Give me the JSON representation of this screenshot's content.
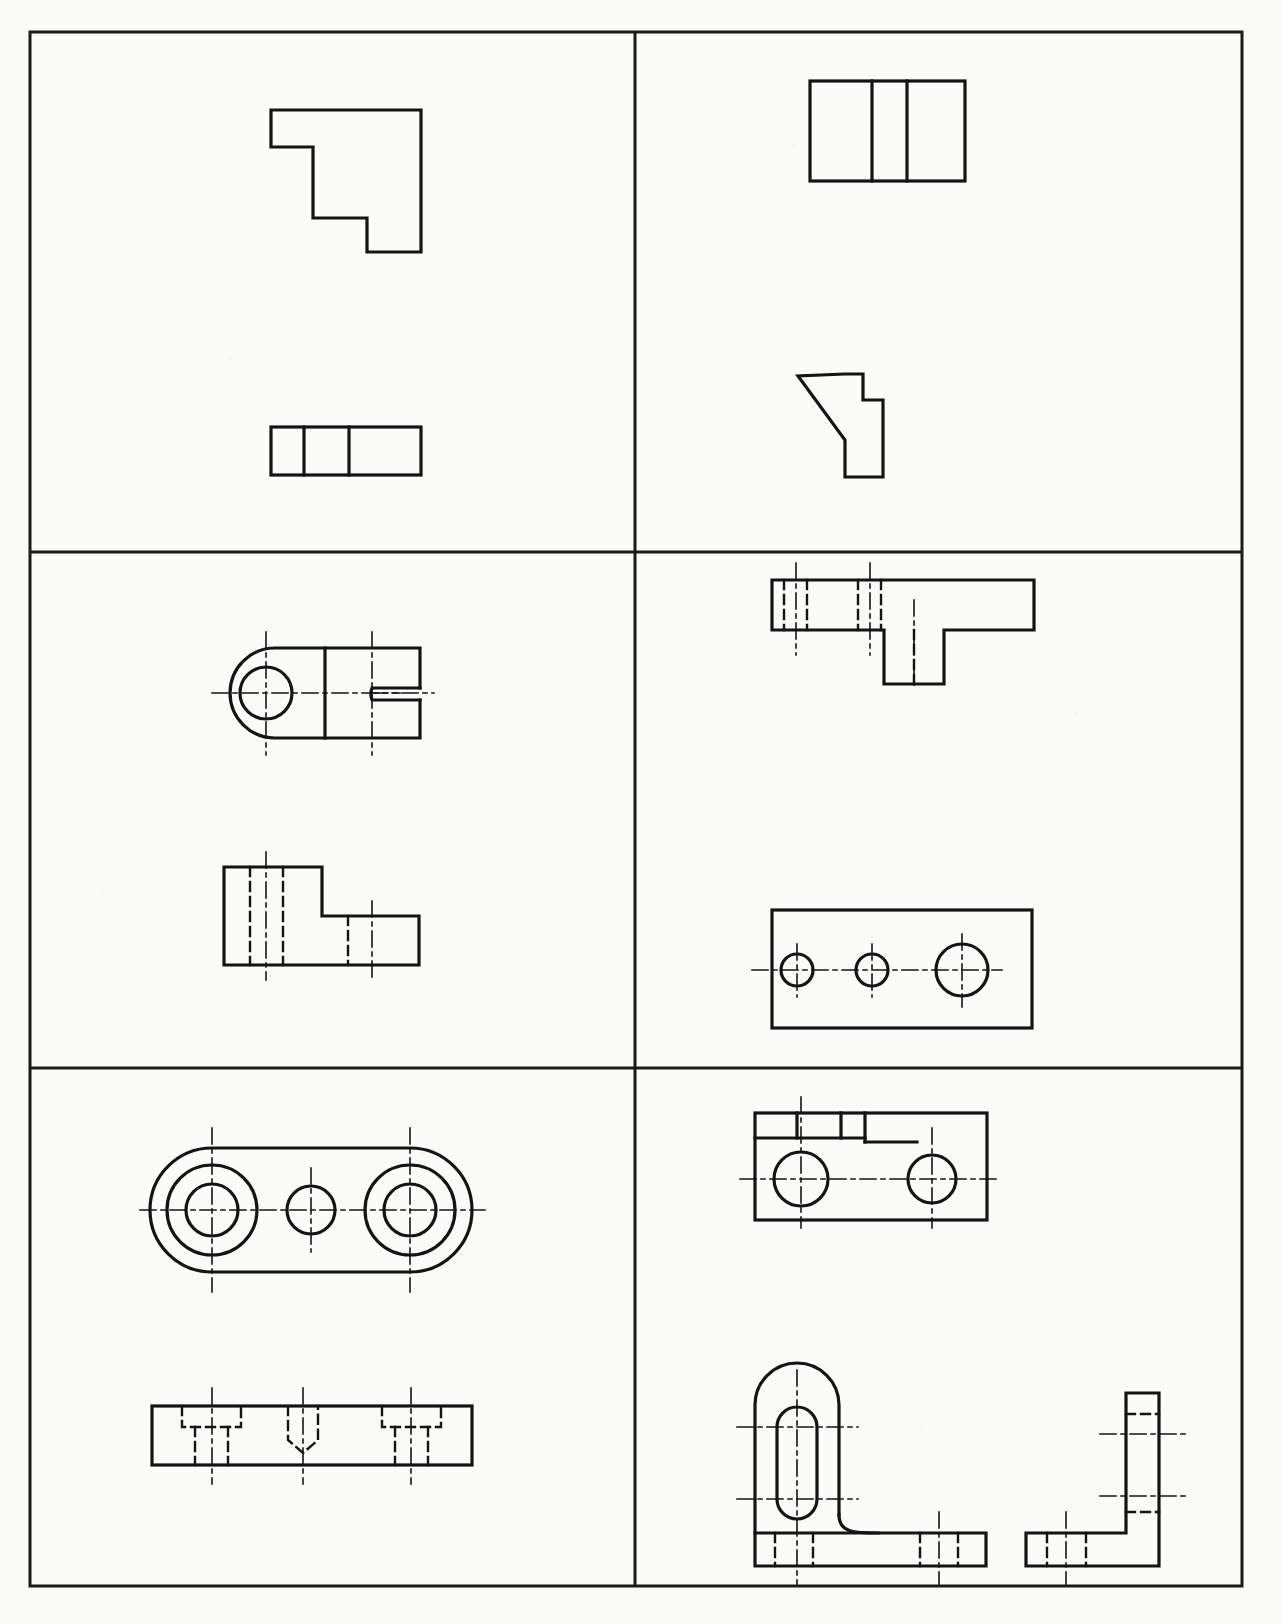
{
  "sheet": {
    "type": "orthographic-projection-exercise-sheet",
    "page_width": 1281,
    "page_height": 1624,
    "cropped_caption": "",
    "border": {
      "x": 30,
      "y": 32,
      "width": 1212,
      "height": 1554,
      "stroke": "#1a1a1a",
      "stroke_width": 3
    },
    "grid": {
      "columns": 2,
      "rows": 3,
      "vertical_dividers": [
        635
      ],
      "horizontal_dividers": [
        552,
        1068
      ],
      "stroke": "#1a1a1a",
      "stroke_width": 3
    },
    "line_styles": {
      "visible_color": "#141414",
      "visible_width": 3.2,
      "hidden_color": "#141414",
      "hidden_width": 2.4,
      "hidden_dash": "9,6",
      "center_color": "#141414",
      "center_width": 1.6,
      "center_dash": "18,5,4,5"
    }
  },
  "cells": [
    {
      "id": "cell-1",
      "position": "top-left",
      "title": "Stepped block — front and top views",
      "views": [
        {
          "name": "front-view",
          "description": "Stepped L-profile outline, two notches on the left edge"
        },
        {
          "name": "top-view",
          "description": "Rectangle divided by two vertical visible lines into three bands"
        }
      ]
    },
    {
      "id": "cell-2",
      "position": "top-right",
      "title": "Chamfered block — top and front views",
      "views": [
        {
          "name": "top-view",
          "description": "Rectangle divided by two vertical visible lines into three bands"
        },
        {
          "name": "front-view",
          "description": "Polygon with an angled chamfer on the upper-left and a step on the right"
        }
      ]
    },
    {
      "id": "cell-3",
      "position": "middle-left",
      "title": "Clevis / fork bracket — top and front views",
      "views": [
        {
          "name": "top-view",
          "description": "Rounded left end with a through hole, straight body, U-shaped slot opening to the right"
        },
        {
          "name": "front-view",
          "description": "Stepped rectangular block with hidden lines for the hole and slot"
        }
      ]
    },
    {
      "id": "cell-4",
      "position": "middle-right",
      "title": "Flanged plate with three holes — front and top views",
      "views": [
        {
          "name": "front-view",
          "description": "Long horizontal bar with a downward boss at the right, hidden lines for two holes"
        },
        {
          "name": "top-view",
          "description": "Rectangle with three circles of increasing diameter on a horizontal centre line"
        }
      ]
    },
    {
      "id": "cell-5",
      "position": "bottom-left",
      "title": "Obround plate — top and front views",
      "views": [
        {
          "name": "top-view",
          "description": "Stadium (obround) outline containing two counterbored holes and one plain hole"
        },
        {
          "name": "front-view",
          "description": "Flat bar with two counterbored holes flanking a blind drilled hole with conical point"
        }
      ]
    },
    {
      "id": "cell-6",
      "position": "bottom-right",
      "title": "Angle bracket — top, front and side views",
      "views": [
        {
          "name": "top-view",
          "description": "Rectangle with two circles on a centre line and a small keyed slot at the upper left"
        },
        {
          "name": "front-view",
          "description": "L-bracket with a rounded upstand containing an obround slot, filleted to the base"
        },
        {
          "name": "side-view",
          "description": "Thin L-shaped section, vertical web on the right and horizontal foot at the bottom"
        }
      ]
    }
  ]
}
